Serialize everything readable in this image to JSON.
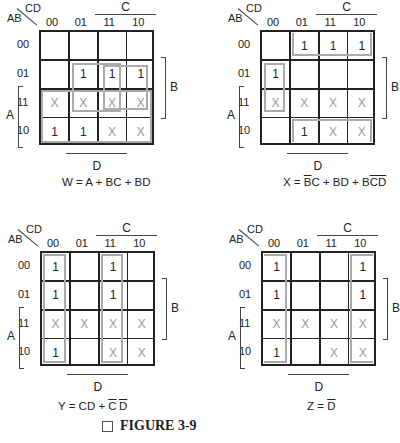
{
  "maps": [
    {
      "id": "W",
      "corner": {
        "row_var": "AB",
        "col_var": "CD"
      },
      "col_labels": [
        "00",
        "01",
        "11",
        "10"
      ],
      "row_labels": [
        "00",
        "01",
        "11",
        "10"
      ],
      "cells": [
        [
          "",
          "",
          "",
          ""
        ],
        [
          "",
          "1",
          "1",
          "1"
        ],
        [
          "X",
          "X",
          "X",
          "X"
        ],
        [
          "1",
          "1",
          "X",
          "X"
        ]
      ],
      "bracket_labels": {
        "C": "C",
        "B": "B",
        "A": "A",
        "D": "D"
      },
      "equation": {
        "lhs": "W",
        "eq": " = ",
        "rhs": "A + BC + BD"
      }
    },
    {
      "id": "X",
      "corner": {
        "row_var": "AB",
        "col_var": "CD"
      },
      "col_labels": [
        "00",
        "01",
        "11",
        "10"
      ],
      "row_labels": [
        "00",
        "01",
        "11",
        "10"
      ],
      "cells": [
        [
          "",
          "1",
          "1",
          "1"
        ],
        [
          "1",
          "",
          "",
          ""
        ],
        [
          "X",
          "X",
          "X",
          "X"
        ],
        [
          "",
          "1",
          "X",
          "X"
        ]
      ],
      "bracket_labels": {
        "C": "C",
        "B": "B",
        "A": "A",
        "D": "D"
      },
      "equation": {
        "lhs": "X",
        "eq": " = ",
        "t1_bar": "B",
        "t1_rest": "C + BD + B",
        "t3_bar": "CD"
      }
    },
    {
      "id": "Y",
      "corner": {
        "row_var": "AB",
        "col_var": "CD"
      },
      "col_labels": [
        "00",
        "01",
        "11",
        "10"
      ],
      "row_labels": [
        "00",
        "01",
        "11",
        "10"
      ],
      "cells": [
        [
          "1",
          "",
          "1",
          ""
        ],
        [
          "1",
          "",
          "1",
          ""
        ],
        [
          "X",
          "X",
          "X",
          "X"
        ],
        [
          "1",
          "",
          "X",
          "X"
        ]
      ],
      "bracket_labels": {
        "C": "C",
        "B": "B",
        "A": "A",
        "D": "D"
      },
      "equation": {
        "lhs": "Y",
        "eq": " = ",
        "t1": "CD + ",
        "t2_bar_c": "C",
        "t2_bar_d": "D"
      }
    },
    {
      "id": "Z",
      "corner": {
        "row_var": "AB",
        "col_var": "CD"
      },
      "col_labels": [
        "00",
        "01",
        "11",
        "10"
      ],
      "row_labels": [
        "00",
        "01",
        "11",
        "10"
      ],
      "cells": [
        [
          "1",
          "",
          "",
          "1"
        ],
        [
          "1",
          "",
          "",
          "1"
        ],
        [
          "X",
          "X",
          "X",
          "X"
        ],
        [
          "1",
          "",
          "X",
          "X"
        ]
      ],
      "bracket_labels": {
        "C": "C",
        "B": "B",
        "A": "A",
        "D": "D"
      },
      "equation": {
        "lhs": "Z",
        "eq": " = ",
        "rhs_bar": "D"
      }
    }
  ],
  "caption": {
    "label": "FIGURE 3-9"
  },
  "colors": {
    "grid": "#222222",
    "group_outline": "#aaaaaa",
    "dont_care": "#999999"
  }
}
